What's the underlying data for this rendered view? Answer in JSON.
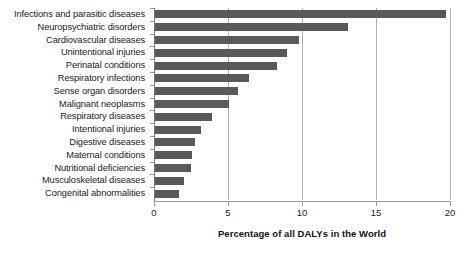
{
  "chart_data": {
    "type": "bar",
    "orientation": "horizontal",
    "title": "",
    "subtitle": "",
    "xlabel": "Percentage of all DALYs in the World",
    "ylabel": "",
    "xlim": [
      0,
      20
    ],
    "xticks": [
      0,
      5,
      10,
      15,
      20
    ],
    "xtick_labels": [
      "0",
      "5",
      "10",
      "15",
      "20"
    ],
    "grid": true,
    "grid_axis": "x",
    "legend": null,
    "bar_color": "#595959",
    "background_color": "#ffffff",
    "gridline_color": "#b3b3b3",
    "axis_color": "#9a9a9a",
    "categories": [
      "Infections and parasitic diseases",
      "Neuropsychiatric disorders",
      "Cardiovascular diseases",
      "Unintentional injuries",
      "Perinatal conditions",
      "Respiratory infections",
      "Sense organ disorders",
      "Malignant neoplasms",
      "Respiratory diseases",
      "Intentional injuries",
      "Digestive diseases",
      "Maternal conditions",
      "Nutritional deficiencies",
      "Musculoskeletal diseases",
      "Congenital abnormalities"
    ],
    "values": [
      19.7,
      13.1,
      9.8,
      9.0,
      8.3,
      6.4,
      5.7,
      5.1,
      3.9,
      3.2,
      2.8,
      2.6,
      2.5,
      2.0,
      1.7
    ]
  }
}
